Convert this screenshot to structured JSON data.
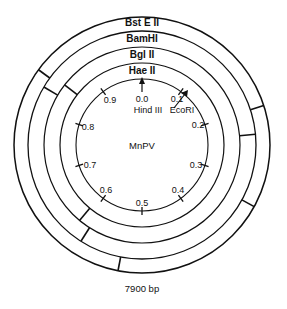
{
  "diagram": {
    "title": "MnPV",
    "genome_size": "7900 bp",
    "center": [
      142,
      145
    ],
    "rings": [
      {
        "name": "HaeII",
        "label": "Hae II",
        "r_inner": 66,
        "r_outer": 82,
        "cuts": []
      },
      {
        "name": "BglII",
        "label": "Bgl II",
        "r_inner": 82,
        "r_outer": 98,
        "cuts": [
          0.855,
          0.61
        ]
      },
      {
        "name": "BamHI",
        "label": "BamHI",
        "r_inner": 98,
        "r_outer": 114,
        "cuts": [
          0.835,
          0.235,
          0.59
        ]
      },
      {
        "name": "BstEII",
        "label": "Bst E II",
        "r_inner": 114,
        "r_outer": 128,
        "cuts": [
          0.85,
          0.2,
          0.53,
          0.33
        ]
      }
    ],
    "map_units": [
      "0.0",
      "0.1",
      "0.2",
      "0.3",
      "0.4",
      "0.5",
      "0.6",
      "0.7",
      "0.8",
      "0.9"
    ],
    "sites": [
      {
        "name": "HindIII",
        "label": "Hind III",
        "position": 0.0
      },
      {
        "name": "EcoRI",
        "label": "EcoRI",
        "position": 0.11
      }
    ]
  }
}
